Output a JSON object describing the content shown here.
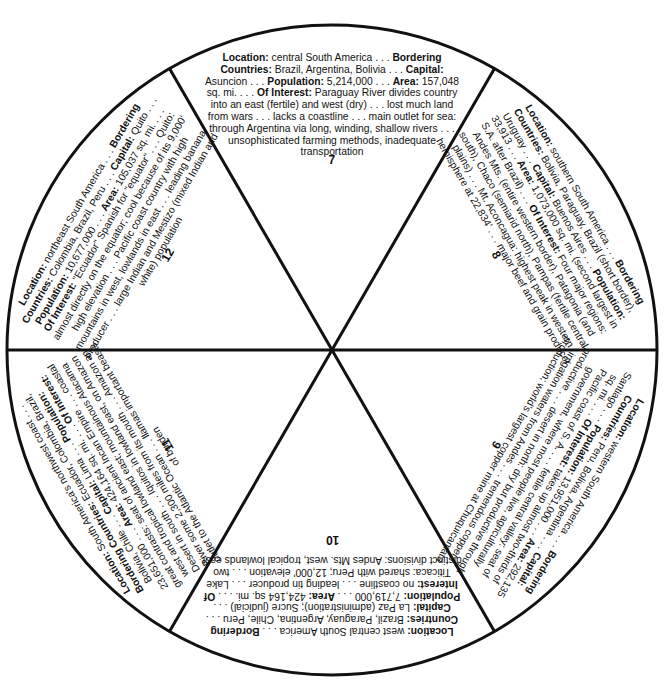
{
  "wheel": {
    "center": [
      332,
      350
    ],
    "radius": 325,
    "stroke_color": "#111111",
    "wedges": [
      {
        "number": "7",
        "country_implied": "Paraguay",
        "angle_deg": 0,
        "location": "central South America . . .",
        "bordering": "Brazil, Argentina, Bolivia . . .",
        "capital": "Asuncion . . .",
        "population": "5,214,000 . . .",
        "area": "157,048 sq. mi. . . .",
        "interest": "Paraguay River divides country into an east (fertile) and west (dry) . . . lost much land from wars . . . lacks a coastline . . . main outlet for sea: through Argentina via long, winding, shallow rivers . . . unsophisticated farming methods, inadequate transportation"
      },
      {
        "number": "8",
        "country_implied": "Argentina",
        "angle_deg": 60,
        "location": "southern South America . . .",
        "bordering": "Bolivia, Paraguay, Brazil (short border), Uruguay . . .",
        "capital": "Buenos Aires . . .",
        "population": "33,913 . . .",
        "area": "1,073,000 sq. mi. (second largest in S.A. after Brazil) . . .",
        "interest": "Four major regions: Andes Mts. (entire western border), Patagonia (and south), Chaco (semiarid north), Pampas (fertile central plains) . . . Mt. Aconcagua: highest peak in western hemisphere at 22,834' . . . major beef and grain producer"
      },
      {
        "number": "9",
        "country_implied": "Chile",
        "angle_deg": 120,
        "location": "western South America . . .",
        "bordering": "Peru, Bolivia, Argentina . . .",
        "capital": "Santiago . . .",
        "population": "13,951,000 . . .",
        "area": "292,135 sq. mi. . . .",
        "interest": "takes up almost two-thirds of Pacific coast of S. A. . . . fertile central valley: seat of government, where most people live, agriculturally productive . . . desert in north: dry but productive through irrigation waters from Andes . . . tremendous copper production; world's largest copper mine at Chuquicamata"
      },
      {
        "number": "10",
        "country_implied": "Bolivia",
        "angle_deg": 180,
        "location": "west central South America . . .",
        "bordering": "Brazil, Paraguay, Argentina, Chile, Peru . . .",
        "capital": "La Paz (administration); Sucre (judicial) . . .",
        "population": "7,719,000 . . .",
        "area": "424,164 sq. mi. . . .",
        "interest": "no coastline . . . leading tin producer . . . Lake Titicaca: shared with Peru; 12,000' elevation . . . two distinct divisions: Andes Mts. west, tropical lowlands east"
      },
      {
        "number": "11",
        "country_implied": "Peru",
        "angle_deg": 240,
        "location": "South America's northwest coast . . .",
        "bordering": "Ecuador, Colombia, Brazil, Bolivia, Chile . . .",
        "capital": "Lima . . .",
        "population": "23,651,000 . . .",
        "area": "424,164 sq. mi. . . .",
        "area_note": "uncertain reading: not fully legible at available zoom; matches wedge 10's value",
        "interest": "great contrasts: seat of ancient Incan Empire . . . coastal west and tropical lowland east; mountainous Atacama Desert in south . . . Iquitos in lowland east, on Amazon River some 2,300 miles from its mouth . . . Amazon an outlet to the Atlantic Ocean . . . llamas important beasts of burden"
      },
      {
        "number": "12",
        "country_implied": "Ecuador",
        "angle_deg": 300,
        "location": "northeast South America . . .",
        "bordering": "Colombia, Brazil, Peru . . .",
        "capital": "Quito . . .",
        "population": "10,677,000 . . .",
        "area": "105,037 sq. mi. . . .",
        "interest": "\"Ecuador\" Spanish for \"equator\" . . . Quito: almost directly on the equator; cool because of its 9,000' high elevation . . . Pacific coast country with high mountains in west, lowlands in east . . . leading banana producer . . . large Indian and Mestizo (mixed Indian and white) population"
      }
    ],
    "labels": {
      "location": "Location:",
      "bordering": "Bordering Countries:",
      "capital": "Capital:",
      "population": "Population:",
      "area": "Area:",
      "interest": "Of Interest:"
    }
  }
}
